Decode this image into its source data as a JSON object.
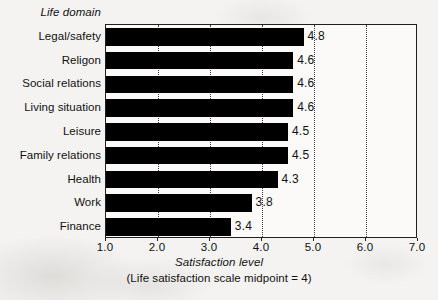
{
  "chart_data": {
    "type": "bar",
    "orientation": "horizontal",
    "title": "",
    "categories": [
      "Legal/safety",
      "Religon",
      "Social relations",
      "Living situation",
      "Leisure",
      "Family relations",
      "Health",
      "Work",
      "Finance"
    ],
    "values": [
      4.8,
      4.6,
      4.6,
      4.6,
      4.5,
      4.5,
      4.3,
      3.8,
      3.4
    ],
    "data_labels": [
      "4.8",
      "4.6",
      "4.6",
      "4.6",
      "4.5",
      "4.5",
      "4.3",
      "3.8",
      "3.4"
    ],
    "category_axis_title": "Life domain",
    "xlabel": "Satisfaction level",
    "ylabel": "Life domain",
    "caption": "(Life satisfaction scale midpoint = 4)",
    "xlim": [
      1.0,
      7.0
    ],
    "xticks": [
      1.0,
      2.0,
      3.0,
      4.0,
      5.0,
      6.0,
      7.0
    ],
    "xtick_labels": [
      "1.0",
      "2.0",
      "3.0",
      "4.0",
      "5.0",
      "6.0",
      "7.0"
    ],
    "grid": "vertical-dotted",
    "legend": "none",
    "bar_color": "#000000",
    "plot_background": "#fbfaf9",
    "axis_color": "#202020"
  }
}
